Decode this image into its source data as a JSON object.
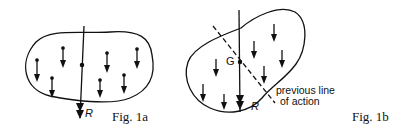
{
  "figure_a": {
    "caption": "Fig. 1a",
    "resultant_label": "R"
  },
  "figure_b": {
    "caption": "Fig. 1b",
    "centroid_label": "G",
    "resultant_label": "R",
    "annotation_line1": "previous line",
    "annotation_line2": "of action"
  },
  "colors": {
    "ink": "#111111",
    "background": "#ffffff"
  }
}
